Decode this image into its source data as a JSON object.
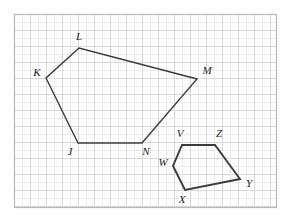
{
  "figure": {
    "background_color": "#ffffff",
    "grid": {
      "border_color": "#b9b9b9",
      "minor_line_color": "#ececec",
      "major_line_color": "#d8d8d8",
      "cell_size_px": 16,
      "subdivisions": 2,
      "origin_x": 14,
      "origin_y": 14,
      "width_px": 263,
      "height_px": 194,
      "columns": 16,
      "rows": 12
    },
    "stroke": {
      "shape_color": "#3b3b3b",
      "shape_width_large": 1.4,
      "shape_width_small": 1.9
    },
    "shapes": [
      {
        "name": "pentagon-jklmn",
        "label": "JKLMN",
        "closed": true,
        "stroke_width": 1.4,
        "vertices": [
          {
            "label": "J",
            "x": 78,
            "y": 143,
            "label_x": 70,
            "label_y": 155,
            "label_anchor": "middle"
          },
          {
            "label": "K",
            "x": 46,
            "y": 78,
            "label_x": 37,
            "label_y": 76,
            "label_anchor": "middle"
          },
          {
            "label": "L",
            "x": 79,
            "y": 48,
            "label_x": 79,
            "label_y": 40,
            "label_anchor": "middle"
          },
          {
            "label": "M",
            "x": 197,
            "y": 79,
            "label_x": 207,
            "label_y": 74,
            "label_anchor": "middle"
          },
          {
            "label": "N",
            "x": 142,
            "y": 143,
            "label_x": 146,
            "label_y": 155,
            "label_anchor": "middle"
          }
        ]
      },
      {
        "name": "pentagon-vwxyz",
        "label": "VWXYZ",
        "closed": true,
        "stroke_width": 1.9,
        "vertices": [
          {
            "label": "V",
            "x": 182,
            "y": 145,
            "label_x": 180,
            "label_y": 137,
            "label_anchor": "middle"
          },
          {
            "label": "Z",
            "x": 215,
            "y": 145,
            "label_x": 219,
            "label_y": 137,
            "label_anchor": "middle"
          },
          {
            "label": "Y",
            "x": 240,
            "y": 179,
            "label_x": 249,
            "label_y": 187,
            "label_anchor": "middle"
          },
          {
            "label": "X",
            "x": 185,
            "y": 190,
            "label_x": 182,
            "label_y": 203,
            "label_anchor": "middle"
          },
          {
            "label": "W",
            "x": 173,
            "y": 166,
            "label_x": 163,
            "label_y": 166,
            "label_anchor": "middle"
          }
        ]
      }
    ]
  }
}
